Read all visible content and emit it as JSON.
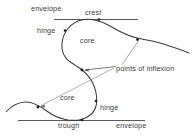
{
  "figure": {
    "background_color": "#ffffff",
    "stroke_color": "#3b3b3b",
    "text_color": "#3b3b3b",
    "width": 196,
    "height": 140
  },
  "labels": {
    "envelope_top": "envelope",
    "crest": "crest",
    "hinge_top": "hinge",
    "core_top": "core",
    "points_of_inflexion": "points of inflexion",
    "core_bottom": "core",
    "hinge_bottom": "hinge",
    "trough": "trough",
    "envelope_bottom": "envelope"
  },
  "elements": {
    "fold_curve_name": "folded-layer-curve",
    "upper_envelope_name": "upper-envelope-line",
    "lower_envelope_name": "lower-envelope-line",
    "inflexion_markers": 3,
    "leader_lines": 3
  },
  "geometry": {
    "upper_envelope": {
      "x1": 54,
      "y1": 19,
      "x2": 138,
      "y2": 19
    },
    "lower_envelope": {
      "x1": 18,
      "y1": 120,
      "x2": 145,
      "y2": 120
    },
    "fold_path": "M 189,53 C 170,46 152,41 137,39 C 120,36 112,27 100,22 C 88,17 74,20 67,30 C 58,43 63,56 76,65 C 88,74 95,84 96,97 C 97,108 92,116 82,119 C 70,123 57,119 47,112 C 40,107 33,102 25,102 C 17,102 11,106 7,111",
    "inflexion_points": [
      {
        "x": 137,
        "y": 39
      },
      {
        "x": 82,
        "y": 70
      },
      {
        "x": 38,
        "y": 107
      }
    ],
    "crest_marker": {
      "x": 100,
      "y": 22
    },
    "trough_marker": {
      "x": 82,
      "y": 119
    },
    "hinge_marker_top": {
      "x": 65,
      "y": 32
    },
    "hinge_marker_bottom": {
      "x": 95,
      "y": 102
    },
    "leaders": [
      {
        "x1": 139,
        "y1": 41,
        "x2": 123,
        "y2": 64
      },
      {
        "x1": 84,
        "y1": 70,
        "x2": 117,
        "y2": 66
      },
      {
        "x1": 40,
        "y1": 106,
        "x2": 114,
        "y2": 68
      }
    ]
  }
}
